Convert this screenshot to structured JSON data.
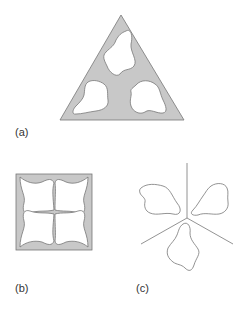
{
  "figure": {
    "panels": [
      {
        "id": "a",
        "label": "(a)",
        "shape": "triangle",
        "description": "Gray triangle with three white blob-shaped cutouts"
      },
      {
        "id": "b",
        "label": "(b)",
        "shape": "square",
        "description": "Gray square with four white blob-shaped regions meeting at center"
      },
      {
        "id": "c",
        "label": "(c)",
        "shape": "three-way-partition",
        "description": "Three outlined blob shapes separated by three lines radiating from a center"
      }
    ],
    "colors": {
      "fill": "#c8c8c8",
      "stroke": "#777777",
      "background": "#ffffff"
    }
  }
}
